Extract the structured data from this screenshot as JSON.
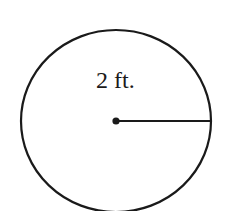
{
  "figure": {
    "type": "circle-with-radius",
    "radius_label": "2 ft.",
    "colors": {
      "stroke": "#1a1a1a",
      "background": "#ffffff"
    }
  }
}
